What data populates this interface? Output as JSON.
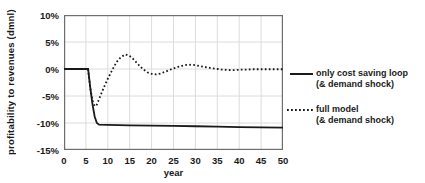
{
  "chart_data": {
    "type": "line",
    "title": "",
    "xlabel": "year",
    "ylabel": "profitability to revenues (dmnl)",
    "xlim": [
      0,
      50
    ],
    "ylim": [
      -15,
      10
    ],
    "grid": true,
    "legend_position": "right",
    "x_ticks": {
      "values": [
        0,
        5,
        10,
        15,
        20,
        25,
        30,
        35,
        40,
        45,
        50
      ],
      "labels": [
        "0",
        "5",
        "10",
        "15",
        "20",
        "25",
        "30",
        "35",
        "40",
        "45",
        "50"
      ]
    },
    "y_ticks": {
      "values": [
        10,
        5,
        0,
        -5,
        -10,
        -15
      ],
      "labels": [
        "10%",
        "5%",
        "0%",
        "-5%",
        "-10%",
        "-15%"
      ]
    },
    "series": [
      {
        "name": "only cost saving loop (& demand shock)",
        "style": "solid",
        "color": "#1a1a1a",
        "points": [
          [
            0,
            0
          ],
          [
            1,
            0
          ],
          [
            2,
            0
          ],
          [
            3,
            0
          ],
          [
            4,
            0
          ],
          [
            5,
            0
          ],
          [
            5.5,
            0
          ],
          [
            6,
            -3.5
          ],
          [
            6.5,
            -6.5
          ],
          [
            7,
            -8.8
          ],
          [
            7.5,
            -10.0
          ],
          [
            8,
            -10.3
          ],
          [
            10,
            -10.35
          ],
          [
            15,
            -10.45
          ],
          [
            20,
            -10.5
          ],
          [
            25,
            -10.55
          ],
          [
            30,
            -10.6
          ],
          [
            35,
            -10.68
          ],
          [
            40,
            -10.75
          ],
          [
            45,
            -10.8
          ],
          [
            50,
            -10.85
          ]
        ]
      },
      {
        "name": "full model (& demand shock)",
        "style": "dotted",
        "color": "#1a1a1a",
        "points": [
          [
            0,
            0
          ],
          [
            1,
            0
          ],
          [
            2,
            0
          ],
          [
            3,
            0
          ],
          [
            4,
            0
          ],
          [
            5,
            0
          ],
          [
            5.5,
            0
          ],
          [
            6,
            -3.5
          ],
          [
            6.5,
            -5.8
          ],
          [
            7,
            -6.9
          ],
          [
            7.5,
            -6.6
          ],
          [
            8,
            -5.6
          ],
          [
            9,
            -3.6
          ],
          [
            10,
            -1.8
          ],
          [
            11,
            -0.2
          ],
          [
            12,
            1.3
          ],
          [
            13,
            2.2
          ],
          [
            14,
            2.7
          ],
          [
            15,
            2.4
          ],
          [
            16,
            1.7
          ],
          [
            17,
            0.8
          ],
          [
            18,
            0
          ],
          [
            19,
            -0.6
          ],
          [
            20,
            -0.9
          ],
          [
            21,
            -1.0
          ],
          [
            22,
            -0.85
          ],
          [
            23,
            -0.55
          ],
          [
            24,
            -0.2
          ],
          [
            25,
            0.1
          ],
          [
            26,
            0.4
          ],
          [
            27,
            0.6
          ],
          [
            28,
            0.75
          ],
          [
            29,
            0.8
          ],
          [
            30,
            0.7
          ],
          [
            31,
            0.55
          ],
          [
            32,
            0.4
          ],
          [
            33,
            0.25
          ],
          [
            34,
            0.1
          ],
          [
            35,
            0
          ],
          [
            36,
            -0.1
          ],
          [
            37,
            -0.15
          ],
          [
            38,
            -0.2
          ],
          [
            39,
            -0.2
          ],
          [
            40,
            -0.15
          ],
          [
            41,
            -0.1
          ],
          [
            42,
            -0.1
          ],
          [
            43,
            -0.05
          ],
          [
            44,
            -0.05
          ],
          [
            45,
            -0.05
          ],
          [
            46,
            -0.05
          ],
          [
            47,
            -0.05
          ],
          [
            48,
            -0.05
          ],
          [
            49,
            -0.05
          ],
          [
            50,
            -0.05
          ]
        ]
      }
    ]
  },
  "legend": {
    "items": [
      {
        "line1": "only cost saving loop",
        "line2": "(& demand shock)",
        "style": "solid"
      },
      {
        "line1": "full model",
        "line2": "(& demand shock)",
        "style": "dotted"
      }
    ]
  },
  "colors": {
    "line": "#1a1a1a",
    "grid": "#dcdcdc",
    "plot_border": "#6e6e6e",
    "background": "#ffffff",
    "text": "#1a1a1a"
  }
}
